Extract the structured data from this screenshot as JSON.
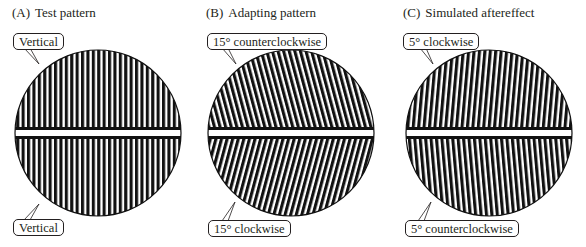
{
  "figure": {
    "panels": [
      {
        "id": "A",
        "letter": "(A)",
        "title": "Test pattern",
        "top_label": "Vertical",
        "bottom_label": "Vertical",
        "top_tilt_deg": 0,
        "bottom_tilt_deg": 0
      },
      {
        "id": "B",
        "letter": "(B)",
        "title": "Adapting pattern",
        "top_label": "15° counterclockwise",
        "bottom_label": "15° clockwise",
        "top_tilt_deg": -15,
        "bottom_tilt_deg": 15
      },
      {
        "id": "C",
        "letter": "(C)",
        "title": "Simulated aftereffect",
        "top_label": "5° clockwise",
        "bottom_label": "5° counterclockwise",
        "top_tilt_deg": 5,
        "bottom_tilt_deg": -5
      }
    ],
    "colors": {
      "stripe": "#111111",
      "background": "#ffffff",
      "text": "#231f20"
    }
  }
}
